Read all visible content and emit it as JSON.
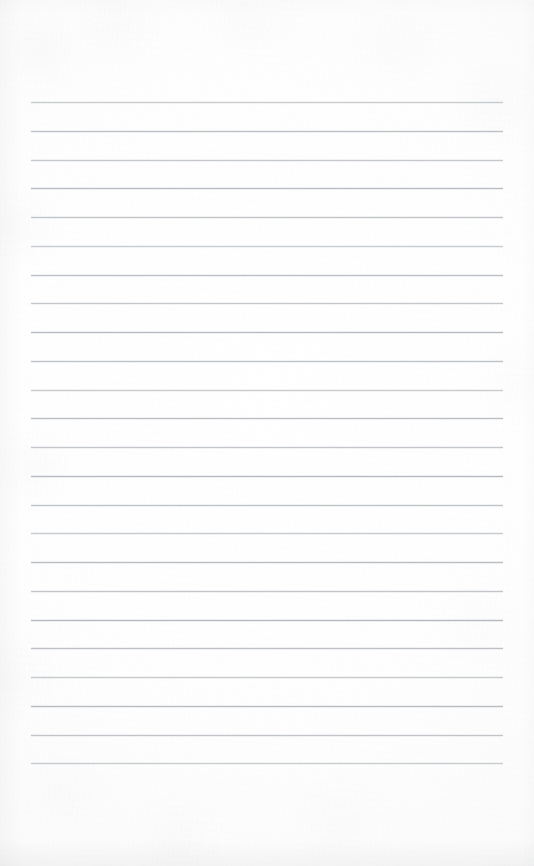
{
  "document": {
    "kind": "lined-notebook-page",
    "title": "Blank ruled notebook page",
    "content_text": "",
    "has_handwriting": false,
    "has_printed_text": false
  },
  "page": {
    "width": 534,
    "height": 866,
    "background_color": "#fdfdfd",
    "paper_tint_color": "#fbfbfb",
    "edge_shade_color": "#989aa0"
  },
  "ruling": {
    "line_color": "#b6babf",
    "line_thickness": 1,
    "line_count": 24,
    "line_left_x": 31,
    "line_right_x": 503,
    "line_width": 472,
    "first_line_y": 102,
    "last_line_y": 763,
    "line_spacing": 28.74,
    "top_margin": 102,
    "bottom_margin": 103,
    "left_margin": 31,
    "right_margin": 31,
    "line_y_positions": [
      102,
      131,
      160,
      188,
      217,
      246,
      275,
      303,
      332,
      361,
      390,
      418,
      447,
      476,
      505,
      533,
      562,
      591,
      620,
      648,
      677,
      706,
      735,
      763
    ]
  }
}
